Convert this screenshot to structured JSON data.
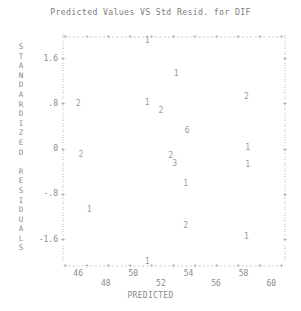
{
  "chart_data": {
    "type": "scatter",
    "title": "Predicted Values VS Std Resid. for DIF",
    "xlabel": "PREDICTED",
    "ylabel": "STANDARDIZED RESIDUALS",
    "xlim": [
      44.9,
      61.0
    ],
    "ylim": [
      -2.05,
      2.0
    ],
    "grid": false,
    "legend": null,
    "xticks": [
      46,
      48,
      50,
      52,
      54,
      56,
      58,
      60
    ],
    "xtick_labels": [
      "46",
      "48",
      "50",
      "52",
      "54",
      "56",
      "58",
      "60"
    ],
    "yticks": [
      1.6,
      0.8,
      0,
      -0.8,
      -1.6
    ],
    "ytick_labels": [
      "1.6",
      ".8",
      "0",
      "-.8",
      "-1.6"
    ],
    "ylabel_letters": [
      "S",
      "T",
      "A",
      "N",
      "D",
      "A",
      "R",
      "D",
      "I",
      "Z",
      "E",
      "D",
      "",
      "R",
      "E",
      "S",
      "I",
      "D",
      "U",
      "A",
      "L",
      "S"
    ],
    "point_note": "each plotted glyph is a count of overlapping observations",
    "points": [
      {
        "label": "1",
        "x": 51.0,
        "y": 1.92
      },
      {
        "label": "1",
        "x": 53.1,
        "y": 1.33
      },
      {
        "label": "2",
        "x": 46.0,
        "y": 0.8
      },
      {
        "label": "1",
        "x": 51.0,
        "y": 0.82
      },
      {
        "label": "2",
        "x": 52.0,
        "y": 0.68
      },
      {
        "label": "2",
        "x": 58.2,
        "y": 0.92
      },
      {
        "label": "6",
        "x": 53.9,
        "y": 0.32
      },
      {
        "label": "2",
        "x": 52.7,
        "y": -0.12
      },
      {
        "label": "3",
        "x": 53.0,
        "y": -0.26
      },
      {
        "label": "2",
        "x": 46.2,
        "y": -0.1
      },
      {
        "label": "1",
        "x": 58.3,
        "y": 0.02
      },
      {
        "label": "1",
        "x": 58.3,
        "y": -0.28
      },
      {
        "label": "1",
        "x": 53.8,
        "y": -0.62
      },
      {
        "label": "1",
        "x": 46.8,
        "y": -1.08
      },
      {
        "label": "2",
        "x": 53.8,
        "y": -1.36
      },
      {
        "label": "1",
        "x": 58.2,
        "y": -1.56
      },
      {
        "label": "1",
        "x": 51.0,
        "y": -2.0
      }
    ]
  },
  "frame": {
    "top_row": "+----+----+----+----+----+----+----+----+----+----+----+----+--+",
    "bottom_row": "+----+----+----+----+----+----+----+----+----+----+----+----+--+",
    "side_char": ":",
    "tick_char": "+"
  }
}
